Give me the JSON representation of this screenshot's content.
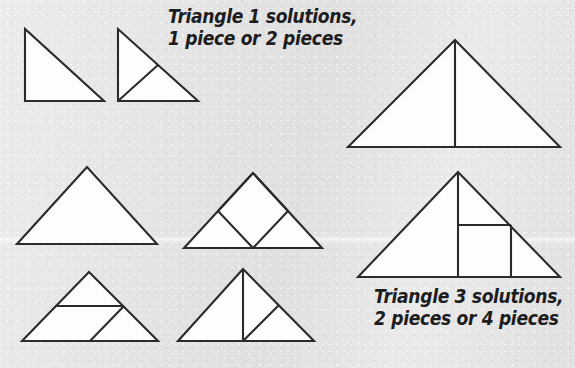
{
  "page": {
    "background_color": "#e4e4e4",
    "ink_color": "#2b2b2b",
    "shape_fill_color": "#fdfdfd",
    "width": 575,
    "height": 368
  },
  "captions": {
    "triangle1": {
      "line1": "Triangle 1 solutions,",
      "line2": "1 piece or 2 pieces"
    },
    "triangle3": {
      "line1": "Triangle 3 solutions,",
      "line2": "2 pieces or 4 pieces"
    }
  },
  "figures": [
    {
      "id": "t1-one-piece",
      "label": "triangle-1-one-piece",
      "description": "Right triangle, right angle at lower left, undivided",
      "pieces": 1
    },
    {
      "id": "t1-two-piece",
      "label": "triangle-1-two-pieces",
      "description": "Right triangle cut from lower-left corner to midpoint of hypotenuse",
      "pieces": 2
    },
    {
      "id": "t2-one-piece",
      "label": "triangle-2-one-piece",
      "description": "Isosceles triangle, undivided",
      "pieces": 1
    },
    {
      "id": "t2-square-inscribed",
      "label": "triangle-2-inscribed-square",
      "description": "Isosceles triangle with inscribed diamond square touching base midpoint and both legs",
      "pieces": 3
    },
    {
      "id": "t2-midline-cut",
      "label": "triangle-2-midline-and-diagonal",
      "description": "Isosceles triangle with horizontal midline and diagonal from base midpoint to right end of midline",
      "pieces": 3
    },
    {
      "id": "t2-altitude-cut",
      "label": "triangle-2-altitude-and-diagonal",
      "description": "Isosceles triangle with vertical altitude and diagonal from base midpoint to midpoint of right side",
      "pieces": 3
    },
    {
      "id": "t3-two-piece",
      "label": "triangle-3-two-pieces",
      "description": "Isosceles triangle split by a vertical altitude from apex to base",
      "pieces": 2
    },
    {
      "id": "t3-four-piece",
      "label": "triangle-3-four-pieces",
      "description": "Isosceles triangle with vertical altitude plus a square cut right of the altitude",
      "pieces": 4
    }
  ]
}
